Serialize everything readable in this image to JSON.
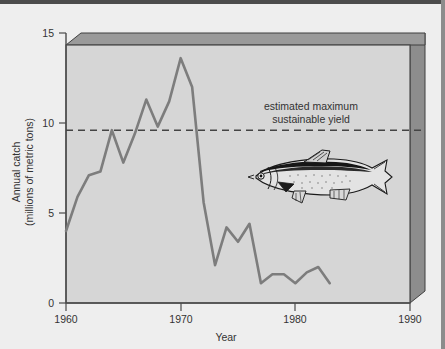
{
  "chart_data": {
    "type": "line",
    "title": "",
    "subtitle": "",
    "xlabel": "Year",
    "ylabel_line1": "Annual catch",
    "ylabel_line2": "(millions of metric tons)",
    "xlim": [
      1960,
      1990
    ],
    "ylim": [
      0,
      15
    ],
    "xticks": [
      1960,
      1970,
      1980,
      1990
    ],
    "xtick_labels": [
      "1960",
      "1970",
      "1980",
      "1990"
    ],
    "yticks": [
      0,
      5,
      10,
      15
    ],
    "ytick_labels": [
      "0",
      "5",
      "10",
      "15"
    ],
    "grid": false,
    "legend": "none",
    "series": [
      {
        "name": "Annual catch",
        "color": "#7d7d7d",
        "x": [
          1960,
          1961,
          1962,
          1963,
          1964,
          1965,
          1966,
          1967,
          1968,
          1969,
          1970,
          1971,
          1972,
          1973,
          1974,
          1975,
          1976,
          1977,
          1978,
          1979,
          1980,
          1981,
          1982,
          1983
        ],
        "values": [
          4.0,
          5.9,
          7.1,
          7.3,
          9.6,
          7.8,
          9.4,
          11.3,
          9.8,
          11.2,
          13.6,
          12.0,
          5.6,
          2.1,
          4.2,
          3.4,
          4.4,
          1.1,
          1.6,
          1.6,
          1.1,
          1.7,
          2.0,
          1.1
        ]
      }
    ],
    "reference_line": {
      "label_line1": "estimated maximum",
      "label_line2": "sustainable yield",
      "value": 9.6,
      "style": "dashed",
      "color": "#444444"
    },
    "annotations": [
      {
        "name": "fish-illustration",
        "kind": "image",
        "description": "sardine"
      }
    ]
  },
  "colors": {
    "page_background": "#eeeeee",
    "plot_background": "#d6d6d6",
    "box_top_face": "#9a9a9a",
    "box_right_face": "#8d8d8d",
    "axis_line": "#4a4a4a",
    "data_line": "#7d7d7d",
    "text": "#333333"
  }
}
